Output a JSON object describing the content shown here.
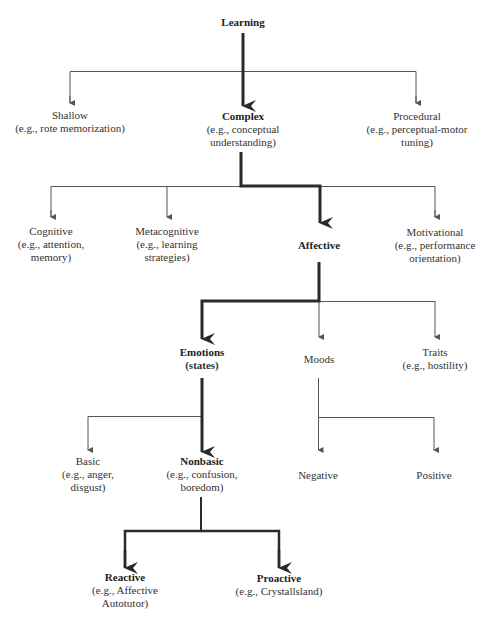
{
  "diagram": {
    "nodes": {
      "learning": {
        "title": "Learning",
        "lines": []
      },
      "shallow": {
        "title": "Shallow",
        "lines": [
          "(e.g., rote memorization)"
        ]
      },
      "complex": {
        "title": "Complex",
        "lines": [
          "(e.g., conceptual",
          "understanding)"
        ]
      },
      "procedural": {
        "title": "Procedural",
        "lines": [
          "(e.g., perceptual-motor",
          "tuning)"
        ]
      },
      "cognitive": {
        "title": "Cognitive",
        "lines": [
          "(e.g., attention,",
          "memory)"
        ]
      },
      "metacognitive": {
        "title": "Metacognitive",
        "lines": [
          "(e.g., learning",
          "strategies)"
        ]
      },
      "affective": {
        "title": "Affective",
        "lines": []
      },
      "motivational": {
        "title": "Motivational",
        "lines": [
          "(e.g., performance",
          "orientation)"
        ]
      },
      "emotions": {
        "title": "Emotions",
        "lines": [
          "(states)"
        ]
      },
      "moods": {
        "title": "Moods",
        "lines": []
      },
      "traits": {
        "title": "Traits",
        "lines": [
          "(e.g., hostility)"
        ]
      },
      "basic": {
        "title": "Basic",
        "lines": [
          "(e.g., anger,",
          "disgust)"
        ]
      },
      "nonbasic": {
        "title": "Nonbasic",
        "lines": [
          "(e.g., confusion,",
          "boredom)"
        ]
      },
      "negative": {
        "title": "Negative",
        "lines": []
      },
      "positive": {
        "title": "Positive",
        "lines": []
      },
      "reactive": {
        "title": "Reactive",
        "lines": [
          "(e.g., Affective",
          "Autotutor)"
        ]
      },
      "proactive": {
        "title": "Proactive",
        "lines": [
          "(e.g., Crystallsland)"
        ]
      }
    },
    "highlighted_path": [
      "learning",
      "complex",
      "affective",
      "emotions",
      "nonbasic",
      "reactive",
      "proactive"
    ],
    "colors": {
      "line": "#555555",
      "thick_line": "#2a2a2a",
      "text": "#333333"
    }
  }
}
